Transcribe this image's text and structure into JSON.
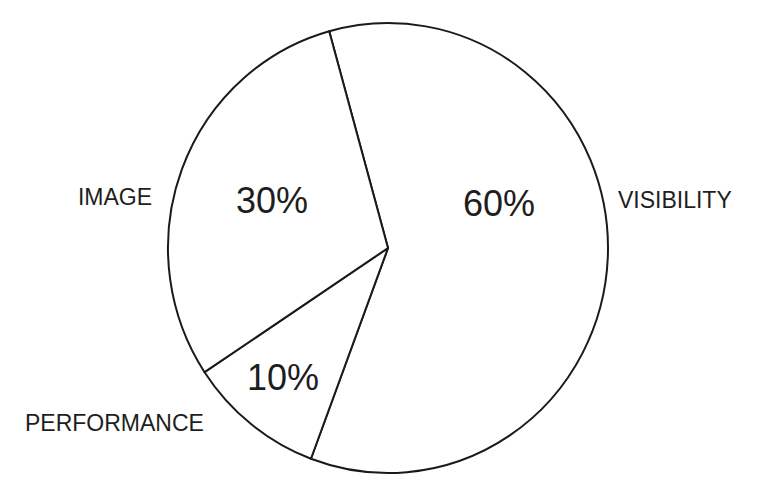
{
  "chart_data": {
    "type": "pie",
    "title": "",
    "categories": [
      "VISIBILITY",
      "PERFORMANCE",
      "IMAGE"
    ],
    "values": [
      60,
      10,
      30
    ],
    "value_labels": [
      "60%",
      "10%",
      "30%"
    ],
    "unit": "%",
    "start_angle_deg_clockwise_from_top": -15.5,
    "direction": "clockwise",
    "legend": "none (labels placed outside slices)",
    "fill_color": "#ffffff",
    "stroke_color": "#1a1a1a",
    "text_color": "#1e1e1e",
    "slices": [
      {
        "label": "VISIBILITY",
        "value": 60,
        "value_label": "60%"
      },
      {
        "label": "PERFORMANCE",
        "value": 10,
        "value_label": "10%"
      },
      {
        "label": "IMAGE",
        "value": 30,
        "value_label": "30%"
      }
    ]
  },
  "labels": {
    "visibility": "VISIBILITY",
    "performance": "PERFORMANCE",
    "image": "IMAGE"
  },
  "percentages": {
    "visibility": "60%",
    "performance": "10%",
    "image": "30%"
  }
}
